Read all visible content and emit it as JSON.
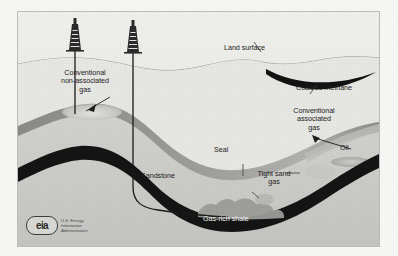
{
  "figure": {
    "type": "geologic-cross-section-diagram",
    "labels": {
      "land_surface": "Land surface",
      "coalbed_methane": "Coalbed methane",
      "conventional_non_associated_gas": "Conventional\nnon-associated\ngas",
      "conventional_associated_gas": "Conventional\nassociated\ngas",
      "oil": "Oil",
      "seal": "Seal",
      "sandstone": "Sandstone",
      "tight_sand_gas": "Tight sand\ngas",
      "gas_rich_shale": "Gas-rich shale"
    },
    "logo": {
      "mark_text": "eia",
      "wordmark": "U.S. Energy\nInformation\nAdministration"
    },
    "colors": {
      "background": "#e9e9e6",
      "upper_strata": "#e3e3e0",
      "sandstone": "#c9c9c6",
      "seal_band": "#8f8f8d",
      "shale_band": "#141414",
      "coalbed_seam": "#121212",
      "gas_pocket": "#d9d9d6",
      "tight_sand_blob": "#b4b4b1",
      "wellbore": "#1a1a1a",
      "label_text": "#1d1d1d",
      "label_text_on_dark": "#f2f2f2",
      "frame": "#8c8c8a",
      "page": "#f7f7f5"
    },
    "features": [
      {
        "name": "derrick-left",
        "kind": "drilling-rig",
        "x": 57,
        "y": 35
      },
      {
        "name": "derrick-right",
        "kind": "drilling-rig",
        "x": 115,
        "y": 37
      },
      {
        "name": "vertical-well",
        "kind": "wellbore",
        "target": "conventional non-associated gas"
      },
      {
        "name": "horizontal-well",
        "kind": "wellbore",
        "target": "gas-rich shale"
      },
      {
        "name": "anticline-trap",
        "kind": "structural-trap"
      }
    ]
  }
}
